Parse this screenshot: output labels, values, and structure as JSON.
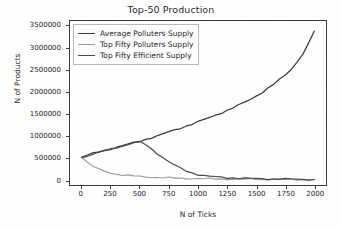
{
  "chart_data": {
    "type": "line",
    "title": "Top-50 Production",
    "xlabel": "N of Ticks",
    "ylabel": "N of Products",
    "xlim": [
      -100,
      2100
    ],
    "ylim": [
      -120000,
      3620000
    ],
    "grid": false,
    "legend_position": "upper left",
    "xticks": [
      0,
      250,
      500,
      750,
      1000,
      1250,
      1500,
      1750,
      2000
    ],
    "xtick_labels": [
      "0",
      "250",
      "500",
      "750",
      "1000",
      "1250",
      "1500",
      "1750",
      "2000"
    ],
    "yticks": [
      0,
      500000,
      1000000,
      1500000,
      2000000,
      2500000,
      3000000,
      3500000
    ],
    "ytick_labels": [
      "0",
      "500000",
      "1000000",
      "1500000",
      "2000000",
      "2500000",
      "3000000",
      "3500000"
    ],
    "x": [
      0,
      50,
      100,
      150,
      200,
      250,
      300,
      350,
      400,
      450,
      500,
      550,
      600,
      650,
      700,
      750,
      800,
      850,
      900,
      950,
      1000,
      1050,
      1100,
      1150,
      1200,
      1250,
      1300,
      1350,
      1400,
      1450,
      1500,
      1550,
      1600,
      1650,
      1700,
      1750,
      1800,
      1850,
      1900,
      1950,
      2000
    ],
    "series": [
      {
        "name": "Average Polluters Supply",
        "color": "#3c3c3c",
        "linewidth": 1.3,
        "values": [
          510000,
          560000,
          600000,
          635000,
          670000,
          705000,
          740000,
          775000,
          810000,
          845000,
          880000,
          920000,
          960000,
          1000000,
          1045000,
          1090000,
          1135000,
          1180000,
          1225000,
          1270000,
          1320000,
          1370000,
          1420000,
          1470000,
          1525000,
          1580000,
          1640000,
          1700000,
          1765000,
          1835000,
          1910000,
          1990000,
          2080000,
          2175000,
          2280000,
          2390000,
          2520000,
          2680000,
          2870000,
          3100000,
          3390000
        ]
      },
      {
        "name": "Top Fifty Polluters Supply",
        "color": "#9a9a9a",
        "linewidth": 1.1,
        "values": [
          505000,
          390000,
          300000,
          235000,
          190000,
          155000,
          130000,
          110000,
          95000,
          83000,
          73000,
          65000,
          58000,
          52000,
          47000,
          42000,
          38000,
          34000,
          31000,
          28000,
          25000,
          23000,
          21000,
          19000,
          17500,
          16000,
          14500,
          13000,
          12000,
          11000,
          10000,
          9000,
          8200,
          7500,
          6800,
          6200,
          5600,
          5000,
          4500,
          4000,
          3500
        ]
      },
      {
        "name": "Top Fifty Efficient Supply",
        "color": "#4a4a4a",
        "linewidth": 1.2,
        "values": [
          505000,
          545000,
          585000,
          625000,
          665000,
          700000,
          735000,
          770000,
          805000,
          840000,
          860000,
          800000,
          700000,
          600000,
          500000,
          410000,
          330000,
          260000,
          200000,
          155000,
          120000,
          95000,
          78000,
          65000,
          55000,
          47000,
          41000,
          36000,
          32000,
          29000,
          26000,
          24000,
          22000,
          20000,
          18000,
          16000,
          14000,
          12000,
          10000,
          8000,
          6000
        ]
      }
    ]
  },
  "legend": {
    "items": [
      {
        "label": "Average Polluters Supply"
      },
      {
        "label": "Top Fifty Polluters Supply"
      },
      {
        "label": "Top Fifty Efficient Supply"
      }
    ]
  },
  "colors": {
    "axis": "#3a3a3a",
    "text": "#222222",
    "background": "#fefefe",
    "legend_border": "#b8b8b8"
  }
}
